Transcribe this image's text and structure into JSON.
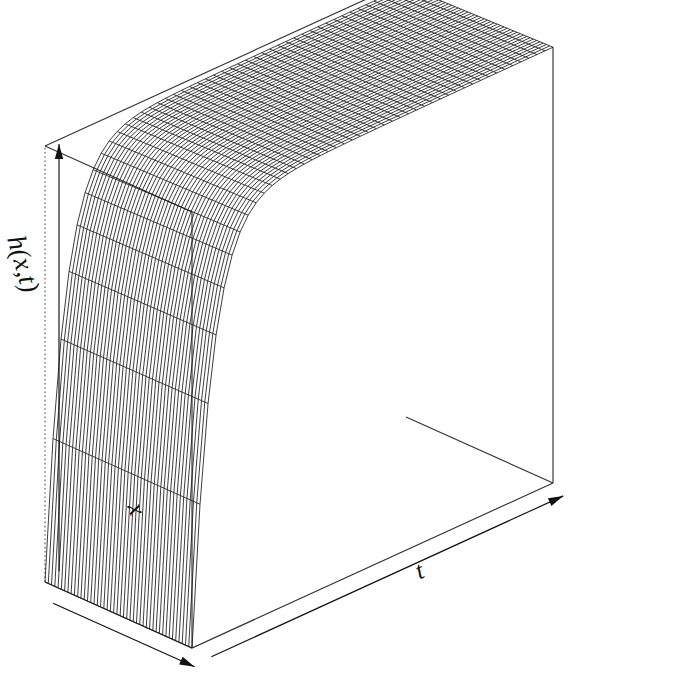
{
  "figure": {
    "kind": "3d-wireframe-surface-plot",
    "background_color": "#ffffff",
    "line_color": "#1a1a1a",
    "box_color": "#333333",
    "width": 684,
    "height": 679
  },
  "labels": {
    "vertical_axis": "h(x,t)",
    "depth_axis": "x",
    "horizontal_axis": "t"
  },
  "axes": {
    "h_axis": {
      "label": "h(x,t)",
      "arrow": "up-left",
      "ticks_shown": false
    },
    "x_axis": {
      "label": "x",
      "arrow": "down-left",
      "ticks_shown": false
    },
    "t_axis": {
      "label": "t",
      "arrow": "right",
      "ticks_shown": false
    }
  },
  "chart_data": {
    "type": "surface",
    "title": "",
    "xlabel": "t",
    "ylabel": "x",
    "zlabel": "h(x,t)",
    "grid": false,
    "legend_position": "none",
    "mesh": {
      "n_t": 45,
      "n_x": 45
    },
    "xlim": [
      0,
      1
    ],
    "ylim": [
      0,
      1
    ],
    "zlim": [
      0,
      1
    ],
    "t": [
      0.0,
      0.02,
      0.04,
      0.06,
      0.08,
      0.1,
      0.15,
      0.2,
      0.3,
      0.4,
      0.5,
      0.6,
      0.7,
      0.8,
      0.9,
      1.0
    ],
    "x": [
      0.0,
      0.1,
      0.2,
      0.3,
      0.4,
      0.5,
      0.6,
      0.7,
      0.8,
      0.9,
      1.0
    ],
    "z_profile_along_t": [
      0.0,
      0.2,
      0.42,
      0.59,
      0.7,
      0.78,
      0.88,
      0.93,
      0.97,
      0.985,
      0.99,
      0.995,
      0.997,
      0.998,
      0.999,
      1.0
    ],
    "z_profile_along_x": [
      1.0,
      1.0,
      0.999,
      0.999,
      0.998,
      0.998,
      0.998,
      0.997,
      0.997,
      0.997,
      0.996
    ],
    "z_surface_formula": "h(x,t) = 1 - exp(-t/tau) with tau ~ 0.05, weak x dependence"
  },
  "view": {
    "projection": "oblique-perspective",
    "theta_deg": 40,
    "phi_deg": 25,
    "box_visible": true,
    "hidden_back_edge_style": "dotted"
  }
}
